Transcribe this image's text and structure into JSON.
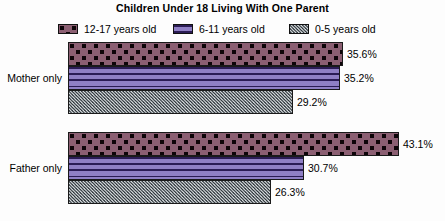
{
  "chart_data": {
    "type": "bar",
    "orientation": "horizontal",
    "title": "Children Under 18 Living With One Parent",
    "xlabel": "",
    "ylabel": "",
    "categories": [
      "Mother only",
      "Father only"
    ],
    "series": [
      {
        "name": "12-17 years old",
        "values": [
          35.6,
          43.1
        ],
        "labels": [
          "35.6%",
          "30.7%"
        ],
        "color": "#8b5f72",
        "pattern": "dots"
      },
      {
        "name": "6-11 years old",
        "values": [
          35.2,
          30.7
        ],
        "color": "#8f7fc4",
        "pattern": "horizontal-lines"
      },
      {
        "name": "0-5 years old",
        "values": [
          29.2,
          26.3
        ],
        "color": "#59636b",
        "pattern": "speckle"
      }
    ],
    "value_labels": {
      "mother_only": [
        "35.6%",
        "35.2%",
        "29.2%"
      ],
      "father_only": [
        "43.1%",
        "30.7%",
        "26.3%"
      ]
    },
    "xlim": [
      0,
      43.1
    ],
    "grid": false,
    "legend_position": "top"
  },
  "title": "Children Under 18 Living With One Parent",
  "legend": {
    "items": [
      {
        "label": "12-17 years old",
        "left": 0
      },
      {
        "label": "6-11 years old",
        "left": 115
      },
      {
        "label": "0-5 years old",
        "left": 231
      }
    ]
  },
  "groups": [
    {
      "label": "Mother only",
      "bars": [
        {
          "series": "12-17 years old",
          "value_label": "35.6%",
          "width": 275,
          "top": 4
        },
        {
          "series": "6-11 years old",
          "value_label": "35.2%",
          "width": 272,
          "top": 28
        },
        {
          "series": "0-5 years old",
          "value_label": "29.2%",
          "width": 225,
          "top": 52
        }
      ]
    },
    {
      "label": "Father only",
      "bars": [
        {
          "series": "12-17 years old",
          "value_label": "43.1%",
          "width": 331,
          "top": 94
        },
        {
          "series": "6-11 years old",
          "value_label": "30.7%",
          "width": 236,
          "top": 118
        },
        {
          "series": "0-5 years old",
          "value_label": "26.3%",
          "width": 203,
          "top": 142
        }
      ]
    }
  ]
}
